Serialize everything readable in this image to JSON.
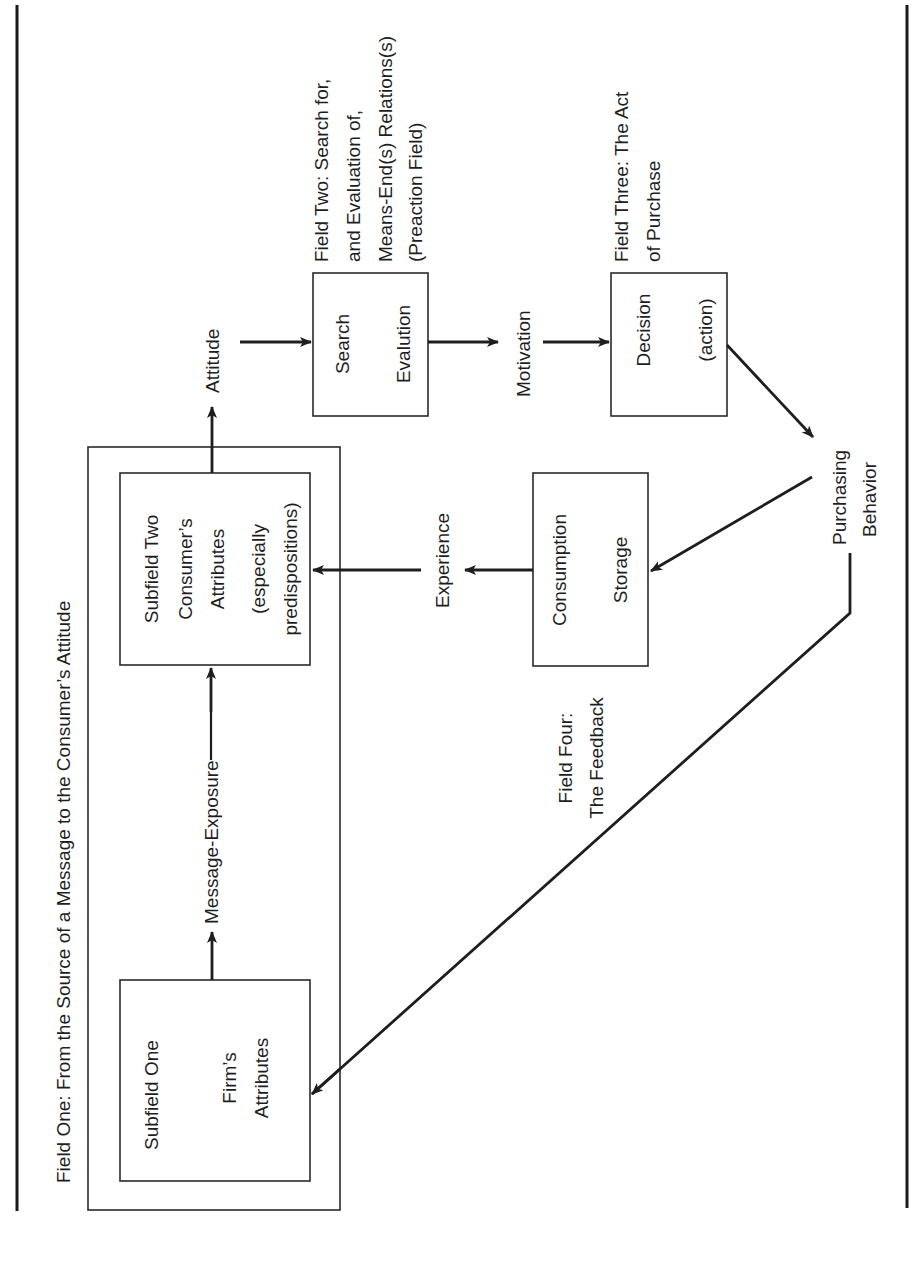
{
  "diagram": {
    "orientation": "rotated 90 degrees counter-clockwise",
    "fields": {
      "field_one": {
        "label": "Field One:  From the Source of a Message to the Consumer’s Attitude"
      },
      "field_two": {
        "lines": [
          "Field Two:  Search for,",
          "and Evaluation of,",
          "Means-End(s)  Relations(s)",
          "(Preaction Field)"
        ]
      },
      "field_three": {
        "lines": [
          "Field Three:  The Act",
          "of Purchase"
        ]
      },
      "field_four": {
        "lines": [
          "Field Four:",
          "The Feedback"
        ]
      }
    },
    "nodes": {
      "subfield_one": {
        "lines": [
          "Subfield One",
          "Firm’s",
          "Attributes"
        ]
      },
      "subfield_two": {
        "lines": [
          "Subfield Two",
          "Consumer’s",
          "Attributes",
          "(especially",
          "predispositions)"
        ]
      },
      "search_evaluation": {
        "lines": [
          "Search",
          "Evalution"
        ]
      },
      "decision": {
        "lines": [
          "Decision",
          "(action)"
        ]
      },
      "consumption_storage": {
        "lines": [
          "Consumption",
          "Storage"
        ]
      }
    },
    "edge_labels": {
      "message_exposure": "Message-Exposure",
      "attitude": "Attitude",
      "motivation": "Motivation",
      "experience": "Experience",
      "purchasing_behavior": [
        "Purchasing",
        "Behavior"
      ]
    },
    "colors": {
      "ink": "#1e1e1e",
      "background": "#ffffff"
    }
  }
}
